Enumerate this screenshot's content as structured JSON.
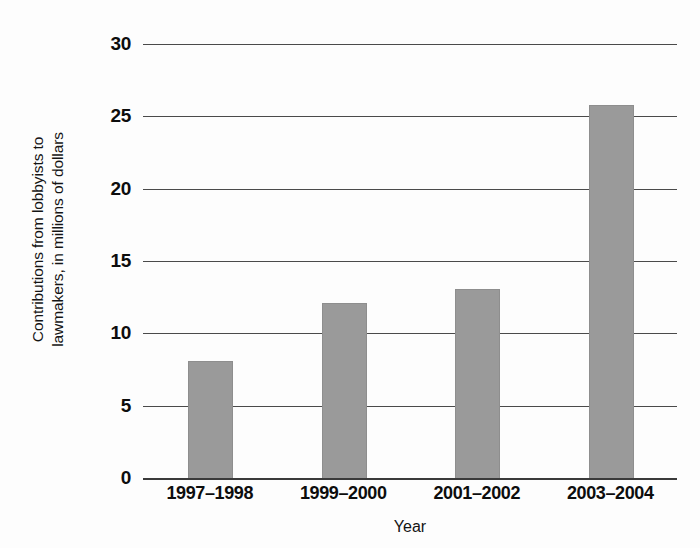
{
  "chart_data": {
    "type": "bar",
    "title": "",
    "xlabel": "Year",
    "ylabel": "Contributions from lobbyists to lawmakers, in millions of dollars",
    "ylabel_lines": [
      "Contributions from lobbyists to",
      "lawmakers, in millions of dollars"
    ],
    "categories": [
      "1997–1998",
      "1999–2000",
      "2001–2002",
      "2003–2004"
    ],
    "values": [
      8,
      12,
      13,
      25.7
    ],
    "ylim": [
      0,
      30
    ],
    "ytick_values": [
      0,
      5,
      10,
      15,
      20,
      25,
      30
    ],
    "ytick_labels": [
      "0",
      "5",
      "10",
      "15",
      "20",
      "25",
      "30"
    ],
    "grid": true,
    "legend": false,
    "legend_position": "none",
    "bar_color": "#9a9a9a",
    "gridline_color": "#4a4a4a",
    "axis_color": "#3a3a3a",
    "background_color": "#fdfdfd",
    "text_color": "#0d0d0d"
  }
}
